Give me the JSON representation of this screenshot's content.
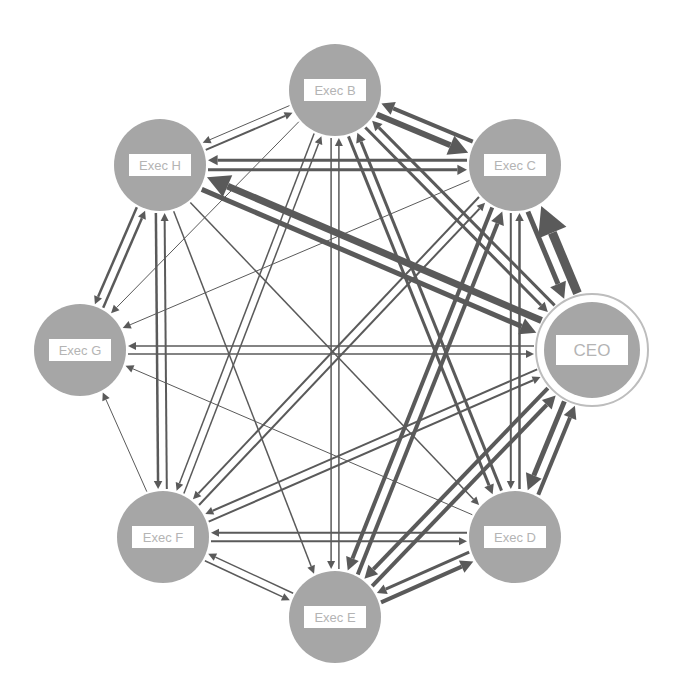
{
  "diagram": {
    "type": "directed-network",
    "colors": {
      "node_fill": "#a6a6a6",
      "node_fill_light": "#c2c2c2",
      "edge": "#5a5a5a",
      "label_box": "#ffffff",
      "label_text": "#b4b4b4",
      "ceo_ring": "#bdbdbd"
    },
    "nodes": [
      {
        "id": "B",
        "label": "Exec B",
        "x": 335,
        "y": 90,
        "r": 46
      },
      {
        "id": "C",
        "label": "Exec C",
        "x": 515,
        "y": 165,
        "r": 46
      },
      {
        "id": "CEO",
        "label": "CEO",
        "x": 592,
        "y": 350,
        "r": 48,
        "ring": true
      },
      {
        "id": "D",
        "label": "Exec D",
        "x": 515,
        "y": 537,
        "r": 46
      },
      {
        "id": "E",
        "label": "Exec E",
        "x": 335,
        "y": 617,
        "r": 46
      },
      {
        "id": "F",
        "label": "Exec F",
        "x": 163,
        "y": 537,
        "r": 46
      },
      {
        "id": "G",
        "label": "Exec G",
        "x": 80,
        "y": 350,
        "r": 46
      },
      {
        "id": "H",
        "label": "Exec H",
        "x": 160,
        "y": 165,
        "r": 46
      }
    ],
    "edges": [
      {
        "from": "C",
        "to": "B",
        "w": 4
      },
      {
        "from": "B",
        "to": "C",
        "w": 6
      },
      {
        "from": "C",
        "to": "CEO",
        "w": 5
      },
      {
        "from": "CEO",
        "to": "C",
        "w": 9
      },
      {
        "from": "CEO",
        "to": "D",
        "w": 5
      },
      {
        "from": "D",
        "to": "CEO",
        "w": 4
      },
      {
        "from": "D",
        "to": "E",
        "w": 3
      },
      {
        "from": "E",
        "to": "D",
        "w": 4
      },
      {
        "from": "E",
        "to": "F",
        "w": 1.5
      },
      {
        "from": "F",
        "to": "E",
        "w": 1.5
      },
      {
        "from": "F",
        "to": "G",
        "w": 1
      },
      {
        "from": "G",
        "to": "H",
        "w": 2.5
      },
      {
        "from": "H",
        "to": "G",
        "w": 2.5
      },
      {
        "from": "H",
        "to": "B",
        "w": 2
      },
      {
        "from": "B",
        "to": "H",
        "w": 1
      },
      {
        "from": "C",
        "to": "H",
        "w": 3
      },
      {
        "from": "H",
        "to": "C",
        "w": 3
      },
      {
        "from": "CEO",
        "to": "H",
        "w": 7
      },
      {
        "from": "H",
        "to": "CEO",
        "w": 5
      },
      {
        "from": "CEO",
        "to": "G",
        "w": 1.5
      },
      {
        "from": "G",
        "to": "CEO",
        "w": 1.5
      },
      {
        "from": "CEO",
        "to": "F",
        "w": 2
      },
      {
        "from": "F",
        "to": "CEO",
        "w": 2
      },
      {
        "from": "CEO",
        "to": "E",
        "w": 4
      },
      {
        "from": "E",
        "to": "CEO",
        "w": 4
      },
      {
        "from": "CEO",
        "to": "B",
        "w": 3
      },
      {
        "from": "B",
        "to": "CEO",
        "w": 3
      },
      {
        "from": "C",
        "to": "D",
        "w": 2
      },
      {
        "from": "D",
        "to": "C",
        "w": 2.5
      },
      {
        "from": "C",
        "to": "E",
        "w": 4
      },
      {
        "from": "E",
        "to": "C",
        "w": 4
      },
      {
        "from": "C",
        "to": "F",
        "w": 2
      },
      {
        "from": "F",
        "to": "C",
        "w": 2
      },
      {
        "from": "C",
        "to": "G",
        "w": 1
      },
      {
        "from": "B",
        "to": "D",
        "w": 3
      },
      {
        "from": "D",
        "to": "B",
        "w": 3
      },
      {
        "from": "B",
        "to": "E",
        "w": 1.5
      },
      {
        "from": "E",
        "to": "B",
        "w": 1.5
      },
      {
        "from": "B",
        "to": "F",
        "w": 1.5
      },
      {
        "from": "F",
        "to": "B",
        "w": 1.5
      },
      {
        "from": "H",
        "to": "F",
        "w": 2.5
      },
      {
        "from": "F",
        "to": "H",
        "w": 2
      },
      {
        "from": "H",
        "to": "E",
        "w": 1.5
      },
      {
        "from": "H",
        "to": "D",
        "w": 1.5
      },
      {
        "from": "D",
        "to": "F",
        "w": 2
      },
      {
        "from": "F",
        "to": "D",
        "w": 2
      },
      {
        "from": "D",
        "to": "G",
        "w": 1
      },
      {
        "from": "B",
        "to": "G",
        "w": 1
      }
    ]
  }
}
